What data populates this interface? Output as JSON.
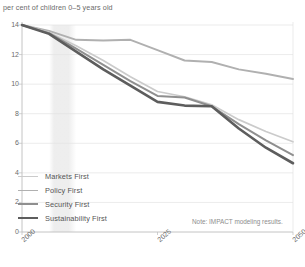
{
  "axis_title": "per cent of children 0–5 years old",
  "note": "Note: IMPACT modeling results.",
  "yticks": [
    "0",
    "2",
    "4",
    "6",
    "8",
    "10",
    "12",
    "14"
  ],
  "xticks": [
    "2000",
    "2025",
    "2050"
  ],
  "legend": [
    {
      "label": "Markets First",
      "color": "#cbcbcb",
      "width": 1.7
    },
    {
      "label": "Policy First",
      "color": "#b0b0b0",
      "width": 1.9
    },
    {
      "label": "Security First",
      "color": "#8f8f8f",
      "width": 2.0
    },
    {
      "label": "Sustainability First",
      "color": "#5d5d5d",
      "width": 2.6
    }
  ],
  "colors": {
    "markets": "#cbcbcb",
    "policy": "#b0b0b0",
    "security": "#8f8f8f",
    "sustainability": "#5d5d5d",
    "grid": "#e3e3e3",
    "axis": "#bdbdbd",
    "band": "#ededed",
    "text": "#6b6b6b"
  },
  "band": {
    "start_year": 2005,
    "end_year": 2010
  },
  "chart_data": {
    "type": "line",
    "title": "",
    "xlabel": "",
    "ylabel": "per cent of children 0–5 years old",
    "xlim": [
      2000,
      2050
    ],
    "ylim": [
      0,
      14
    ],
    "grid": true,
    "legend_position": "lower-left",
    "x": [
      2000,
      2005,
      2010,
      2015,
      2020,
      2025,
      2030,
      2035,
      2040,
      2045,
      2050
    ],
    "series": [
      {
        "name": "Policy First",
        "values": [
          14.0,
          13.6,
          13.0,
          12.95,
          13.0,
          12.3,
          11.6,
          11.5,
          11.0,
          10.7,
          10.35
        ]
      },
      {
        "name": "Markets First",
        "values": [
          14.0,
          13.5,
          12.6,
          11.6,
          10.5,
          9.5,
          9.15,
          8.6,
          7.6,
          6.8,
          6.1
        ]
      },
      {
        "name": "Security First",
        "values": [
          14.0,
          13.45,
          12.4,
          11.3,
          10.2,
          9.2,
          9.1,
          8.5,
          7.3,
          6.2,
          5.2
        ]
      },
      {
        "name": "Sustainability First",
        "values": [
          14.0,
          13.4,
          12.2,
          11.0,
          9.9,
          8.8,
          8.55,
          8.5,
          7.0,
          5.7,
          4.65
        ]
      }
    ]
  }
}
